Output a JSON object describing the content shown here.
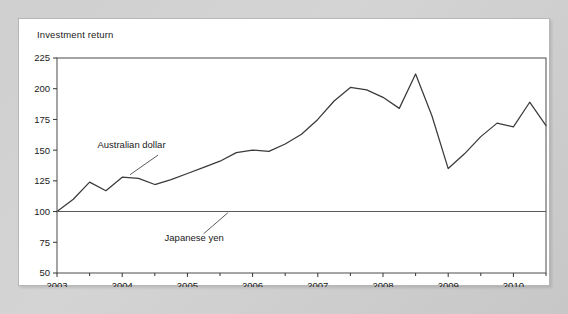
{
  "chart_data": {
    "type": "line",
    "title": "Investment return",
    "xlabel": "",
    "ylabel": "",
    "xlim": [
      2003.0,
      2010.5
    ],
    "ylim": [
      50,
      225
    ],
    "grid": false,
    "legend_position": "inline-annotations",
    "y_ticks": [
      50,
      75,
      100,
      125,
      150,
      175,
      200,
      225
    ],
    "x_ticks": [
      2003,
      2004,
      2005,
      2006,
      2007,
      2008,
      2009,
      2010
    ],
    "x_minor_ticks": [
      2003.5,
      2004.5,
      2005.5,
      2006.5,
      2007.5,
      2008.5,
      2009.5,
      2010.5
    ],
    "annotations": [
      {
        "text": "Australian dollar",
        "series": "Australian dollar"
      },
      {
        "text": "Japanese yen",
        "series": "Japanese yen"
      }
    ],
    "x": [
      2003.0,
      2003.25,
      2003.5,
      2003.75,
      2004.0,
      2004.25,
      2004.5,
      2004.75,
      2005.0,
      2005.25,
      2005.5,
      2005.75,
      2006.0,
      2006.25,
      2006.5,
      2006.75,
      2007.0,
      2007.25,
      2007.5,
      2007.75,
      2008.0,
      2008.25,
      2008.5,
      2008.75,
      2009.0,
      2009.25,
      2009.5,
      2009.75,
      2010.0,
      2010.25,
      2010.5
    ],
    "series": [
      {
        "name": "Australian dollar",
        "values": [
          100,
          110,
          124,
          117,
          128,
          127,
          122,
          126,
          131,
          136,
          141,
          148,
          150,
          149,
          155,
          163,
          175,
          190,
          201,
          199,
          193,
          184,
          212,
          178,
          135,
          147,
          161,
          172,
          169,
          189,
          170
        ]
      },
      {
        "name": "Japanese yen",
        "values": [
          100,
          100,
          100,
          100,
          100,
          100,
          100,
          100,
          100,
          100,
          100,
          100,
          100,
          100,
          100,
          100,
          100,
          100,
          100,
          100,
          100,
          100,
          100,
          100,
          100,
          100,
          100,
          100,
          100,
          100,
          100
        ]
      }
    ]
  },
  "colors": {
    "series_aud": "#3a3a3a",
    "series_jpy": "#5a5a5a",
    "axis": "#333333",
    "card_bg": "#ffffff",
    "page_bg": "#c9c9c9"
  }
}
